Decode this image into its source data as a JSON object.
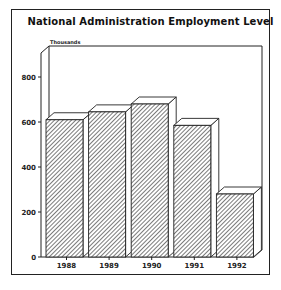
{
  "chart_data": {
    "type": "bar",
    "title": "National Administration Employment Level",
    "ylabel": "Thousands",
    "xlabel": "",
    "categories": [
      "1988",
      "1989",
      "1990",
      "1991",
      "1992"
    ],
    "values": [
      610,
      645,
      680,
      585,
      280
    ],
    "ylim": [
      0,
      800
    ],
    "yticks": [
      0,
      200,
      400,
      600,
      800
    ],
    "grid": false,
    "legend": null,
    "style": "3d hatched bars"
  },
  "colors": {
    "ink": "#222222",
    "background": "#ffffff"
  }
}
